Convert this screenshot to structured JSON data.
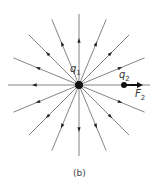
{
  "figure": {
    "caption": "(b)",
    "center_charge": {
      "label": "q",
      "subscript": "1",
      "x": 79,
      "y": 85
    },
    "test_charge": {
      "label": "q",
      "subscript": "2",
      "x": 124,
      "y": 85
    },
    "force": {
      "label": "F",
      "subscript": "2",
      "direction": "right"
    },
    "field_lines": {
      "count": 16,
      "radius": 71,
      "arrow_direction": "outward"
    },
    "colors": {
      "line": "#777777",
      "charge": "#111111",
      "arrow": "#222222"
    }
  }
}
